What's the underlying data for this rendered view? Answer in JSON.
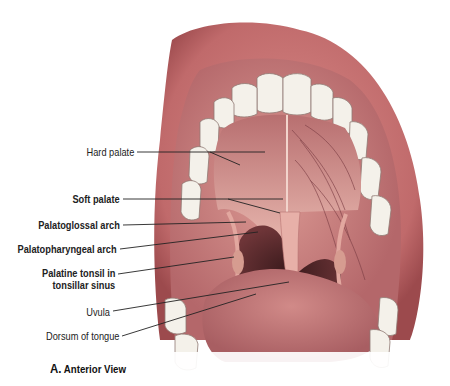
{
  "figure": {
    "caption_letter": "A.",
    "caption_text": "Anterior View",
    "labels": [
      {
        "id": "hard-palate",
        "text": "Hard palate",
        "bold": false
      },
      {
        "id": "soft-palate",
        "text": "Soft palate",
        "bold": true
      },
      {
        "id": "palatoglossal-arch",
        "text": "Palatoglossal arch",
        "bold": true
      },
      {
        "id": "palatopharyngeal-arch",
        "text": "Palatopharyngeal arch",
        "bold": true
      },
      {
        "id": "palatine-tonsil",
        "text": "Palatine tonsil in",
        "bold": true
      },
      {
        "id": "palatine-tonsil-2",
        "text": "tonsillar sinus",
        "bold": true
      },
      {
        "id": "uvula",
        "text": "Uvula",
        "bold": false
      },
      {
        "id": "dorsum-of-tongue",
        "text": "Dorsum of tongue",
        "bold": false
      }
    ]
  },
  "colors": {
    "lip": "#c96f6f",
    "lip_dark": "#a84f52",
    "mucosa": "#d88a86",
    "palate": "#e7b0a8",
    "throat": "#5a2b2d",
    "tongue": "#c2777a",
    "teeth": "#f4f1ea",
    "leader": "#222222"
  }
}
